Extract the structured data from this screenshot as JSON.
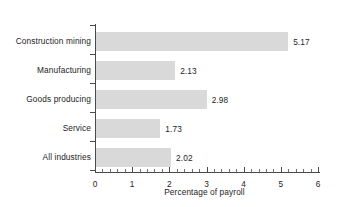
{
  "chart_data": {
    "type": "bar",
    "orientation": "horizontal",
    "title": "",
    "xlabel": "Percentage of payroll",
    "ylabel": "",
    "categories": [
      "Construction mining",
      "Manufacturing",
      "Goods producing",
      "Service",
      "All industries"
    ],
    "values": [
      5.17,
      2.13,
      2.98,
      1.73,
      2.02
    ],
    "data_labels": [
      "5.17",
      "2.13",
      "2.98",
      "1.73",
      "2.02"
    ],
    "xlim": [
      0,
      6
    ],
    "xticks": [
      0,
      1,
      2,
      3,
      4,
      5,
      6
    ],
    "xtick_labels": [
      "0",
      "1",
      "2",
      "3",
      "4",
      "5",
      "6"
    ],
    "minor_tick_step": 0.2,
    "grid": false,
    "legend": false,
    "bar_color": "#d9d9d9",
    "axis_color": "#4a4a4a",
    "text_color": "#1d1d1d"
  }
}
